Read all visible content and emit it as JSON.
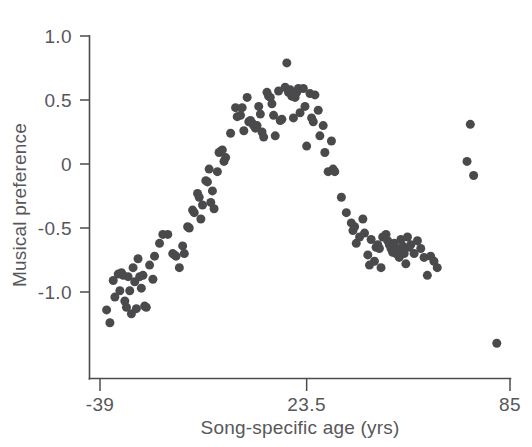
{
  "chart_data": {
    "type": "scatter",
    "title": "",
    "xlabel": "Song-specific age (yrs)",
    "ylabel": "Musical preference",
    "xlim": [
      -39,
      85
    ],
    "ylim": [
      -1.45,
      1.0
    ],
    "grid": false,
    "legend": null,
    "marker": {
      "shape": "circle",
      "color": "#4a4a4c",
      "size_px": 9
    },
    "xticks": [
      -39,
      23.5,
      85
    ],
    "xticklabels": [
      "-39",
      "23.5",
      "85"
    ],
    "yticks": [
      1.0,
      0.5,
      0,
      -0.5,
      -1.0
    ],
    "yticklabels": [
      "1.0",
      "0.5",
      "0",
      "-0.5",
      "-1.0"
    ],
    "series": [
      {
        "name": "Musical preference by song-specific age",
        "points": [
          [
            -37.0,
            -1.14
          ],
          [
            -36.0,
            -1.24
          ],
          [
            -35.0,
            -0.91
          ],
          [
            -34.5,
            -1.04
          ],
          [
            -33.5,
            -0.86
          ],
          [
            -33.0,
            -0.99
          ],
          [
            -32.5,
            -0.85
          ],
          [
            -32.0,
            -0.87
          ],
          [
            -31.5,
            -1.07
          ],
          [
            -31.0,
            -1.12
          ],
          [
            -30.5,
            -0.88
          ],
          [
            -30.0,
            -0.99
          ],
          [
            -29.5,
            -1.17
          ],
          [
            -29.0,
            -0.81
          ],
          [
            -28.5,
            -0.92
          ],
          [
            -28.0,
            -1.13
          ],
          [
            -27.5,
            -0.74
          ],
          [
            -27.0,
            -0.88
          ],
          [
            -26.5,
            -0.97
          ],
          [
            -26.0,
            -0.87
          ],
          [
            -25.5,
            -1.11
          ],
          [
            -25.0,
            -1.12
          ],
          [
            -24.0,
            -0.79
          ],
          [
            -23.0,
            -0.9
          ],
          [
            -22.5,
            -0.72
          ],
          [
            -21.0,
            -0.62
          ],
          [
            -20.0,
            -0.55
          ],
          [
            -18.5,
            -0.55
          ],
          [
            -17.0,
            -0.7
          ],
          [
            -16.5,
            -0.71
          ],
          [
            -16.0,
            -0.72
          ],
          [
            -15.0,
            -0.81
          ],
          [
            -14.0,
            -0.64
          ],
          [
            -13.5,
            -0.7
          ],
          [
            -12.5,
            -0.49
          ],
          [
            -12.0,
            -0.5
          ],
          [
            -11.0,
            -0.36
          ],
          [
            -10.5,
            -0.38
          ],
          [
            -9.5,
            -0.23
          ],
          [
            -9.0,
            -0.26
          ],
          [
            -8.5,
            -0.43
          ],
          [
            -8.0,
            -0.32
          ],
          [
            -7.0,
            -0.13
          ],
          [
            -6.5,
            -0.14
          ],
          [
            -6.0,
            -0.04
          ],
          [
            -5.5,
            -0.3
          ],
          [
            -5.0,
            -0.21
          ],
          [
            -4.5,
            -0.35
          ],
          [
            -3.5,
            -0.06
          ],
          [
            -3.0,
            0.09
          ],
          [
            -2.5,
            0.1
          ],
          [
            -2.0,
            0.11
          ],
          [
            -1.5,
            0.02
          ],
          [
            -1.0,
            0.05
          ],
          [
            0.5,
            0.24
          ],
          [
            2.0,
            0.44
          ],
          [
            2.5,
            0.37
          ],
          [
            3.5,
            0.38
          ],
          [
            4.0,
            0.44
          ],
          [
            4.5,
            0.26
          ],
          [
            5.5,
            0.52
          ],
          [
            6.0,
            0.33
          ],
          [
            6.5,
            0.34
          ],
          [
            7.0,
            0.32
          ],
          [
            7.5,
            0.3
          ],
          [
            8.0,
            0.28
          ],
          [
            8.5,
            0.3
          ],
          [
            9.0,
            0.45
          ],
          [
            9.5,
            0.39
          ],
          [
            10.0,
            0.25
          ],
          [
            10.5,
            0.21
          ],
          [
            11.5,
            0.56
          ],
          [
            12.0,
            0.53
          ],
          [
            12.5,
            0.52
          ],
          [
            13.0,
            0.47
          ],
          [
            13.5,
            0.38
          ],
          [
            14.0,
            0.22
          ],
          [
            15.0,
            0.57
          ],
          [
            15.5,
            0.34
          ],
          [
            16.0,
            0.35
          ],
          [
            17.0,
            0.6
          ],
          [
            17.5,
            0.79
          ],
          [
            18.0,
            0.56
          ],
          [
            18.5,
            0.58
          ],
          [
            19.0,
            0.53
          ],
          [
            19.5,
            0.36
          ],
          [
            20.0,
            0.52
          ],
          [
            20.5,
            0.56
          ],
          [
            21.0,
            0.59
          ],
          [
            21.5,
            0.4
          ],
          [
            22.5,
            0.59
          ],
          [
            23.0,
            0.45
          ],
          [
            23.5,
            0.14
          ],
          [
            24.5,
            0.55
          ],
          [
            25.0,
            0.36
          ],
          [
            25.5,
            0.33
          ],
          [
            26.0,
            0.54
          ],
          [
            27.0,
            0.42
          ],
          [
            27.5,
            0.22
          ],
          [
            28.5,
            0.3
          ],
          [
            29.0,
            0.09
          ],
          [
            30.0,
            -0.06
          ],
          [
            31.0,
            0.18
          ],
          [
            31.5,
            -0.04
          ],
          [
            32.0,
            -0.06
          ],
          [
            34.0,
            -0.26
          ],
          [
            35.5,
            -0.38
          ],
          [
            37.0,
            -0.46
          ],
          [
            37.5,
            -0.52
          ],
          [
            38.0,
            -0.49
          ],
          [
            38.5,
            -0.62
          ],
          [
            39.5,
            -0.57
          ],
          [
            40.5,
            -0.43
          ],
          [
            41.0,
            -0.54
          ],
          [
            42.0,
            -0.71
          ],
          [
            42.5,
            -0.79
          ],
          [
            43.0,
            -0.59
          ],
          [
            44.0,
            -0.76
          ],
          [
            44.5,
            -0.65
          ],
          [
            45.0,
            -0.63
          ],
          [
            45.5,
            -0.66
          ],
          [
            46.0,
            -0.81
          ],
          [
            46.5,
            -0.57
          ],
          [
            47.5,
            -0.55
          ],
          [
            48.0,
            -0.6
          ],
          [
            48.5,
            -0.63
          ],
          [
            49.0,
            -0.66
          ],
          [
            49.5,
            -0.69
          ],
          [
            50.0,
            -0.62
          ],
          [
            50.5,
            -0.7
          ],
          [
            51.0,
            -0.67
          ],
          [
            51.5,
            -0.73
          ],
          [
            52.0,
            -0.59
          ],
          [
            52.5,
            -0.64
          ],
          [
            53.0,
            -0.7
          ],
          [
            53.5,
            -0.78
          ],
          [
            54.0,
            -0.57
          ],
          [
            54.5,
            -0.65
          ],
          [
            55.0,
            -0.63
          ],
          [
            56.0,
            -0.7
          ],
          [
            57.0,
            -0.6
          ],
          [
            58.0,
            -0.66
          ],
          [
            59.0,
            -0.73
          ],
          [
            60.0,
            -0.87
          ],
          [
            61.0,
            -0.72
          ],
          [
            62.0,
            -0.76
          ],
          [
            63.0,
            -0.81
          ],
          [
            73.0,
            0.31
          ],
          [
            72.0,
            0.02
          ],
          [
            74.0,
            -0.09
          ],
          [
            81.0,
            -1.4
          ]
        ]
      }
    ]
  },
  "axes": {
    "y_tick_labels": [
      "1.0",
      "0.5",
      "0",
      "-0.5",
      "-1.0"
    ],
    "x_tick_labels": [
      "-39",
      "23.5",
      "85"
    ],
    "x_title": "Song-specific age (yrs)",
    "y_title": "Musical preference"
  },
  "colors": {
    "marker": "#4a4a4c",
    "axis": "#4c4c4c",
    "text": "#57575a",
    "background": "#ffffff"
  }
}
